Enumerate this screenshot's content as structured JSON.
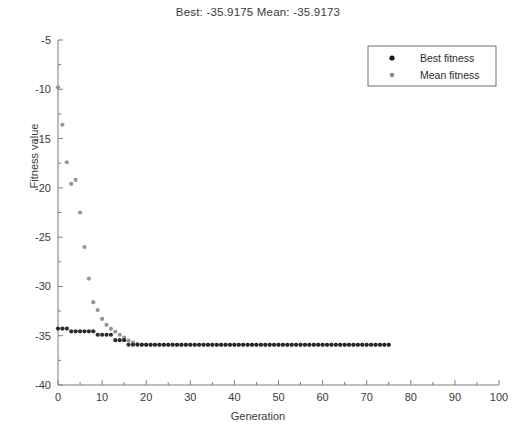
{
  "chart_data": {
    "type": "scatter",
    "title": "Best: -35.9175 Mean: -35.9173",
    "xlabel": "Generation",
    "ylabel": "Fitness value",
    "xlim": [
      0,
      100
    ],
    "ylim": [
      -40,
      -5
    ],
    "xticks": [
      0,
      10,
      20,
      30,
      40,
      50,
      60,
      70,
      80,
      90,
      100
    ],
    "yticks": [
      -40,
      -35,
      -30,
      -25,
      -20,
      -15,
      -10,
      -5
    ],
    "grid": false,
    "legend_position": "top-right",
    "best_value": -35.9175,
    "mean_value": -35.9173,
    "series": [
      {
        "name": "Best fitness",
        "color": "#1b1b1b",
        "marker": "dot",
        "x": [
          0,
          1,
          2,
          3,
          4,
          5,
          6,
          7,
          8,
          9,
          10,
          11,
          12,
          13,
          14,
          15,
          16,
          17,
          18,
          19,
          20,
          21,
          22,
          23,
          24,
          25,
          26,
          27,
          28,
          29,
          30,
          31,
          32,
          33,
          34,
          35,
          36,
          37,
          38,
          39,
          40,
          41,
          42,
          43,
          44,
          45,
          46,
          47,
          48,
          49,
          50,
          51,
          52,
          53,
          54,
          55,
          56,
          57,
          58,
          59,
          60,
          61,
          62,
          63,
          64,
          65,
          66,
          67,
          68,
          69,
          70,
          71,
          72,
          73,
          74,
          75
        ],
        "values": [
          -34.28,
          -34.28,
          -34.28,
          -34.55,
          -34.55,
          -34.55,
          -34.55,
          -34.55,
          -34.55,
          -34.9,
          -34.9,
          -34.9,
          -34.9,
          -35.45,
          -35.45,
          -35.45,
          -35.9175,
          -35.9175,
          -35.9175,
          -35.9175,
          -35.9175,
          -35.9175,
          -35.9175,
          -35.9175,
          -35.9175,
          -35.9175,
          -35.9175,
          -35.9175,
          -35.9175,
          -35.9175,
          -35.9175,
          -35.9175,
          -35.9175,
          -35.9175,
          -35.9175,
          -35.9175,
          -35.9175,
          -35.9175,
          -35.9175,
          -35.9175,
          -35.9175,
          -35.9175,
          -35.9175,
          -35.9175,
          -35.9175,
          -35.9175,
          -35.9175,
          -35.9175,
          -35.9175,
          -35.9175,
          -35.9175,
          -35.9175,
          -35.9175,
          -35.9175,
          -35.9175,
          -35.9175,
          -35.9175,
          -35.9175,
          -35.9175,
          -35.9175,
          -35.9175,
          -35.9175,
          -35.9175,
          -35.9175,
          -35.9175,
          -35.9175,
          -35.9175,
          -35.9175,
          -35.9175,
          -35.9175,
          -35.9175,
          -35.9175,
          -35.9175,
          -35.9175,
          -35.9175,
          -35.9175
        ]
      },
      {
        "name": "Mean fitness",
        "color": "#8c8c8c",
        "marker": "dot",
        "x": [
          0,
          1,
          2,
          3,
          4,
          5,
          6,
          7,
          8,
          9,
          10,
          11,
          12,
          13,
          14,
          15,
          16,
          17,
          18,
          19,
          20,
          21,
          22,
          23,
          24,
          25,
          26,
          27,
          28,
          29,
          30,
          31,
          32,
          33,
          34,
          35,
          36,
          37,
          38,
          39,
          40,
          41,
          42,
          43,
          44,
          45,
          46,
          47,
          48,
          49,
          50,
          51,
          52,
          53,
          54,
          55,
          56,
          57,
          58,
          59,
          60,
          61,
          62,
          63,
          64,
          65,
          66,
          67,
          68,
          69,
          70,
          71,
          72,
          73,
          74,
          75
        ],
        "values": [
          -9.8,
          -13.6,
          -17.4,
          -19.6,
          -19.2,
          -22.5,
          -26.0,
          -29.2,
          -31.6,
          -32.4,
          -33.3,
          -33.9,
          -34.3,
          -34.6,
          -34.9,
          -35.2,
          -35.5,
          -35.7,
          -35.85,
          -35.9,
          -35.91,
          -35.915,
          -35.9173,
          -35.9173,
          -35.9173,
          -35.9173,
          -35.9173,
          -35.9173,
          -35.9173,
          -35.9173,
          -35.9173,
          -35.9173,
          -35.9173,
          -35.9173,
          -35.9173,
          -35.9173,
          -35.9173,
          -35.9173,
          -35.9173,
          -35.9173,
          -35.9173,
          -35.9173,
          -35.9173,
          -35.9173,
          -35.9173,
          -35.9173,
          -35.9173,
          -35.9173,
          -35.9173,
          -35.9173,
          -35.9173,
          -35.9173,
          -35.9173,
          -35.9173,
          -35.9173,
          -35.9173,
          -35.9173,
          -35.9173,
          -35.9173,
          -35.9173,
          -35.9173,
          -35.9173,
          -35.9173,
          -35.9173,
          -35.9173,
          -35.9173,
          -35.9173,
          -35.9173,
          -35.9173,
          -35.9173,
          -35.9173,
          -35.9173,
          -35.9173,
          -35.9173,
          -35.9173,
          -35.9173
        ]
      }
    ]
  },
  "legend": {
    "entries": [
      {
        "label": "Best fitness",
        "color": "#1b1b1b"
      },
      {
        "label": "Mean fitness",
        "color": "#8c8c8c"
      }
    ]
  }
}
